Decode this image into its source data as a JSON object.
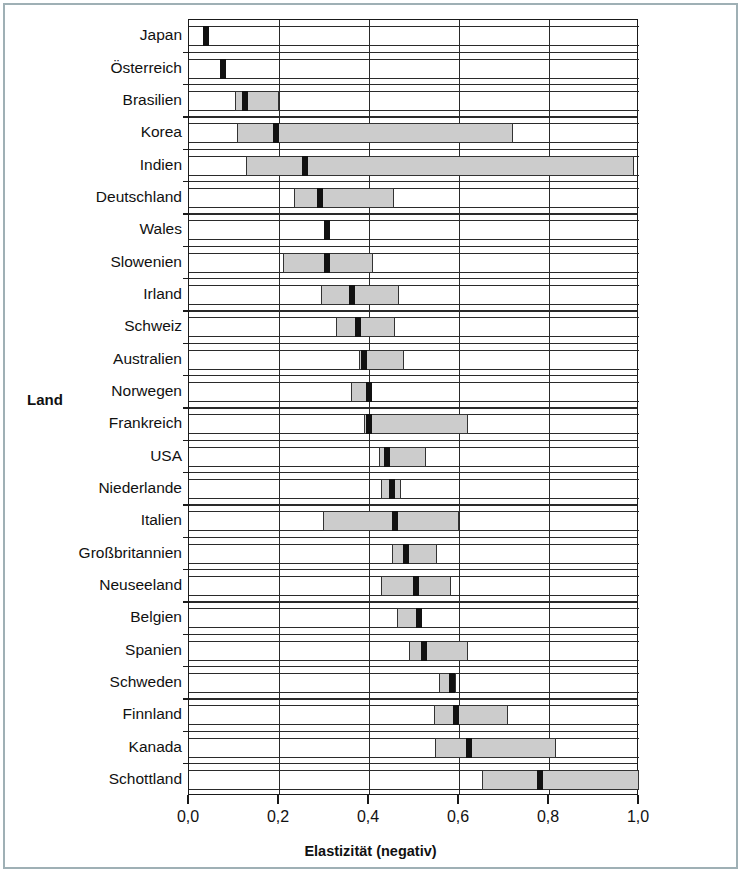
{
  "figure": {
    "y_axis_title": "Land",
    "x_axis_title": "Elastizität (negativ)",
    "x_tick_labels": [
      "0,0",
      "0,2",
      "0,4",
      "0,6",
      "0,8",
      "1,0"
    ],
    "colors": {
      "box_fill": "#cccccc",
      "median_marker": "#111111",
      "line": "#2a2a2a",
      "frame": "#9fb0b5"
    }
  },
  "chart_data": {
    "type": "bar",
    "subtype": "box-and-whisker (horizontal)",
    "title": "",
    "xlabel": "Elastizität (negativ)",
    "ylabel": "Land",
    "xlim": [
      0.0,
      1.0
    ],
    "xticks": [
      0.0,
      0.2,
      0.4,
      0.6,
      0.8,
      1.0
    ],
    "xtick_labels": [
      "0,0",
      "0,2",
      "0,4",
      "0,6",
      "0,8",
      "1,0"
    ],
    "grid": true,
    "legend": "none",
    "categories": [
      "Japan",
      "Österreich",
      "Brasilien",
      "Korea",
      "Indien",
      "Deutschland",
      "Wales",
      "Slowenien",
      "Irland",
      "Schweiz",
      "Australien",
      "Norwegen",
      "Frankreich",
      "USA",
      "Niederlande",
      "Italien",
      "Großbritannien",
      "Neuseeland",
      "Belgien",
      "Spanien",
      "Schweden",
      "Finnland",
      "Kanada",
      "Schottland"
    ],
    "series": [
      {
        "name": "Elastizität (negativ)",
        "boxes": [
          {
            "category": "Japan",
            "whisker_low": 0.0,
            "box_low": 0.03,
            "median": 0.037,
            "box_high": 0.045,
            "whisker_high": 1.0
          },
          {
            "category": "Österreich",
            "whisker_low": 0.0,
            "box_low": 0.069,
            "median": 0.076,
            "box_high": 0.083,
            "whisker_high": 1.0
          },
          {
            "category": "Brasilien",
            "whisker_low": 0.0,
            "box_low": 0.102,
            "median": 0.124,
            "box_high": 0.2,
            "whisker_high": 1.0
          },
          {
            "category": "Korea",
            "whisker_low": 0.0,
            "box_low": 0.107,
            "median": 0.193,
            "box_high": 0.72,
            "whisker_high": 1.0
          },
          {
            "category": "Indien",
            "whisker_low": 0.0,
            "box_low": 0.127,
            "median": 0.258,
            "box_high": 0.99,
            "whisker_high": 1.0
          },
          {
            "category": "Deutschland",
            "whisker_low": 0.0,
            "box_low": 0.233,
            "median": 0.291,
            "box_high": 0.456,
            "whisker_high": 1.0
          },
          {
            "category": "Wales",
            "whisker_low": 0.0,
            "box_low": 0.3,
            "median": 0.307,
            "box_high": 0.314,
            "whisker_high": 1.0
          },
          {
            "category": "Slowenien",
            "whisker_low": 0.0,
            "box_low": 0.209,
            "median": 0.307,
            "box_high": 0.409,
            "whisker_high": 1.0
          },
          {
            "category": "Irland",
            "whisker_low": 0.0,
            "box_low": 0.293,
            "median": 0.362,
            "box_high": 0.467,
            "whisker_high": 1.0
          },
          {
            "category": "Schweiz",
            "whisker_low": 0.0,
            "box_low": 0.327,
            "median": 0.376,
            "box_high": 0.458,
            "whisker_high": 1.0
          },
          {
            "category": "Australien",
            "whisker_low": 0.0,
            "box_low": 0.378,
            "median": 0.389,
            "box_high": 0.478,
            "whisker_high": 1.0
          },
          {
            "category": "Norwegen",
            "whisker_low": 0.0,
            "box_low": 0.36,
            "median": 0.4,
            "box_high": 0.407,
            "whisker_high": 1.0
          },
          {
            "category": "Frankreich",
            "whisker_low": 0.0,
            "box_low": 0.389,
            "median": 0.4,
            "box_high": 0.62,
            "whisker_high": 1.0
          },
          {
            "category": "USA",
            "whisker_low": 0.0,
            "box_low": 0.422,
            "median": 0.44,
            "box_high": 0.527,
            "whisker_high": 1.0
          },
          {
            "category": "Niederlande",
            "whisker_low": 0.0,
            "box_low": 0.427,
            "median": 0.451,
            "box_high": 0.471,
            "whisker_high": 1.0
          },
          {
            "category": "Italien",
            "whisker_low": 0.0,
            "box_low": 0.298,
            "median": 0.458,
            "box_high": 0.6,
            "whisker_high": 1.0
          },
          {
            "category": "Großbritannien",
            "whisker_low": 0.0,
            "box_low": 0.451,
            "median": 0.482,
            "box_high": 0.551,
            "whisker_high": 1.0
          },
          {
            "category": "Neuseeland",
            "whisker_low": 0.0,
            "box_low": 0.427,
            "median": 0.505,
            "box_high": 0.582,
            "whisker_high": 1.0
          },
          {
            "category": "Belgien",
            "whisker_low": 0.0,
            "box_low": 0.462,
            "median": 0.51,
            "box_high": 0.516,
            "whisker_high": 1.0
          },
          {
            "category": "Spanien",
            "whisker_low": 0.0,
            "box_low": 0.489,
            "median": 0.523,
            "box_high": 0.62,
            "whisker_high": 1.0
          },
          {
            "category": "Schweden",
            "whisker_low": 0.0,
            "box_low": 0.556,
            "median": 0.584,
            "box_high": 0.593,
            "whisker_high": 1.0
          },
          {
            "category": "Finnland",
            "whisker_low": 0.0,
            "box_low": 0.544,
            "median": 0.593,
            "box_high": 0.71,
            "whisker_high": 1.0
          },
          {
            "category": "Kanada",
            "whisker_low": 0.0,
            "box_low": 0.547,
            "median": 0.622,
            "box_high": 0.816,
            "whisker_high": 1.0
          },
          {
            "category": "Schottland",
            "whisker_low": 0.0,
            "box_low": 0.651,
            "median": 0.78,
            "box_high": 1.0,
            "whisker_high": 1.0
          }
        ]
      }
    ]
  }
}
